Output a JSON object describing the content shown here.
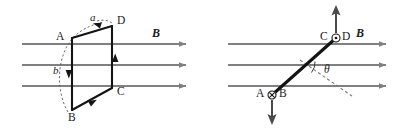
{
  "figure": {
    "title": "",
    "background": "#ffffff",
    "ink_color": "#1a1a1a",
    "field_line_color": "#808080",
    "conductor_color": "#141414"
  },
  "panels": [
    {
      "id": "left",
      "name": "tilted-current-loop-in-uniform-field",
      "field_label": "B",
      "field_lines": {
        "count": 3,
        "direction": "right",
        "y_positions": [
          44,
          65,
          86
        ],
        "x_start": 22,
        "x_end": 188
      },
      "loop": {
        "vertices": [
          {
            "label": "A",
            "x": 72,
            "y": 38
          },
          {
            "label": "D",
            "x": 112,
            "y": 26
          },
          {
            "label": "C",
            "x": 112,
            "y": 88
          },
          {
            "label": "B",
            "x": 72,
            "y": 110
          }
        ],
        "current_sense": "D to A to B to C to D",
        "segment_arrows": [
          {
            "from": "D",
            "to": "A",
            "edge": "top"
          },
          {
            "from": "A",
            "to": "B",
            "edge": "left"
          },
          {
            "from": "B",
            "to": "C",
            "edge": "bottom"
          },
          {
            "from": "C",
            "to": "D",
            "edge": "right"
          }
        ]
      },
      "annotations": [
        {
          "label": "a",
          "kind": "dashed-rotation-arrow",
          "near": "top edge A-D"
        },
        {
          "label": "b",
          "kind": "dashed-arc",
          "near": "left edge A-B"
        }
      ]
    },
    {
      "id": "right",
      "name": "tilted-conductor-cross-section-in-uniform-field",
      "field_label": "B",
      "field_lines": {
        "count": 3,
        "direction": "right",
        "y_positions": [
          44,
          65,
          86
        ],
        "x_start": 28,
        "x_end": 186
      },
      "conductor": {
        "top_end": {
          "labels": [
            "C",
            "D"
          ],
          "marker": "circle-dot",
          "marker_meaning": "out-of-page",
          "x": 135,
          "y": 38
        },
        "bottom_end": {
          "labels": [
            "A",
            "B"
          ],
          "marker": "circle-cross",
          "marker_meaning": "into-page",
          "x": 72,
          "y": 92
        }
      },
      "force_arrows": [
        {
          "name": "upward-arrow",
          "direction": "up",
          "at": "top end"
        },
        {
          "name": "downward-arrow",
          "direction": "down",
          "at": "bottom end"
        }
      ],
      "angle": {
        "label": "θ",
        "between": "conductor and dashed reference line",
        "arc": true
      },
      "reference_line": {
        "style": "dashed",
        "direction": "down-right"
      }
    }
  ],
  "labels": {
    "A": "A",
    "B_point": "B",
    "C": "C",
    "D": "D",
    "a": "a",
    "b": "b",
    "theta": "θ",
    "field_left": "B",
    "field_right": "B"
  }
}
